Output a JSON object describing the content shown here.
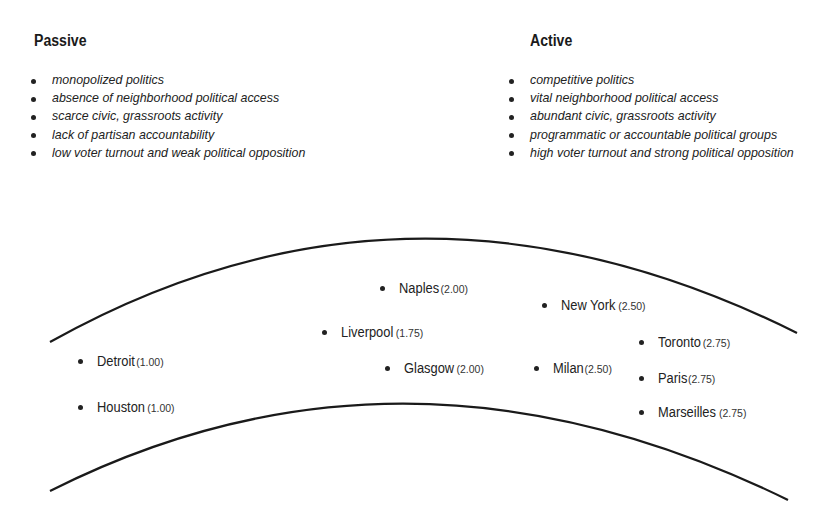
{
  "columns": [
    {
      "title": "Passive",
      "items": [
        "monopolized politics",
        "absence of neighborhood political access",
        "scarce civic, grassroots activity",
        "lack of partisan accountability",
        "low voter turnout and weak political opposition"
      ]
    },
    {
      "title": "Active",
      "items": [
        "competitive politics",
        "vital neighborhood political access",
        "abundant civic, grassroots activity",
        "programmatic or accountable political groups",
        "high voter turnout and strong political opposition"
      ]
    }
  ],
  "cities": [
    {
      "name": "Naples",
      "score": "(2.00)",
      "x": 380,
      "y": 279
    },
    {
      "name": "New York",
      "score": "(2.50)",
      "x": 542,
      "y": 296
    },
    {
      "name": "Liverpool",
      "score": "(1.75)",
      "x": 322,
      "y": 323
    },
    {
      "name": "Toronto",
      "score": "(2.75)",
      "x": 639,
      "y": 333
    },
    {
      "name": "Detroit",
      "score": "(1.00)",
      "x": 78,
      "y": 352
    },
    {
      "name": "Glasgow",
      "score": "(2.00)",
      "x": 385,
      "y": 359
    },
    {
      "name": "Milan",
      "score": "(2.50)",
      "x": 534,
      "y": 359
    },
    {
      "name": "Paris",
      "score": "(2.75)",
      "x": 639,
      "y": 369
    },
    {
      "name": "Houston",
      "score": "(1.00)",
      "x": 78,
      "y": 398
    },
    {
      "name": "Marseilles",
      "score": "(2.75)",
      "x": 639,
      "y": 403
    }
  ]
}
